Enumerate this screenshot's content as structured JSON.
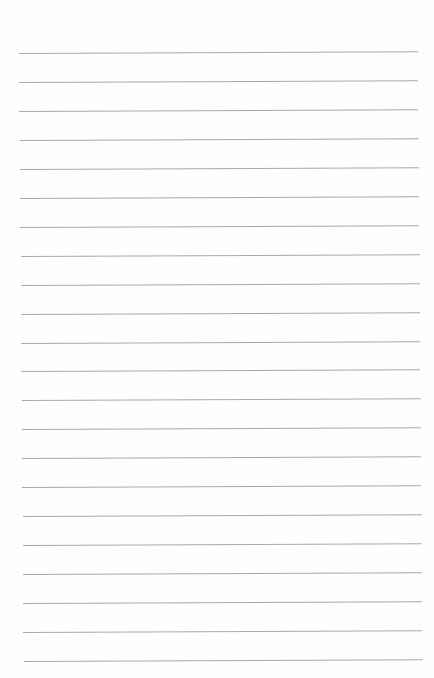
{
  "page": {
    "type": "lined-paper",
    "background_color": "#fefefe",
    "rule_color": "#a9a9a9",
    "rule_count": 22,
    "first_rule_y": 53,
    "rule_spacing": 28.95,
    "rule_x_start": 19,
    "rule_x_end": 418
  }
}
